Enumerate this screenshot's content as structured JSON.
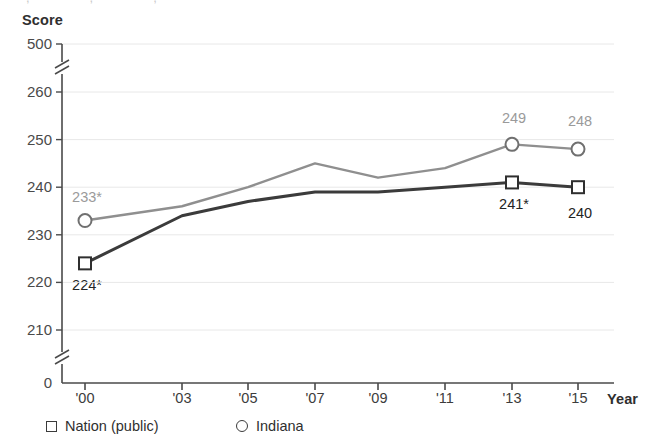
{
  "chart_data": {
    "type": "line",
    "title": "",
    "xlabel": "Year",
    "ylabel": "Score",
    "x": [
      "'00",
      "'03",
      "'05",
      "'07",
      "'09",
      "'11",
      "'13",
      "'15"
    ],
    "x_values": [
      2000,
      2003,
      2005,
      2007,
      2009,
      2011,
      2013,
      2015
    ],
    "ylim": [
      0,
      500
    ],
    "y_ticks": [
      "0",
      "210",
      "220",
      "230",
      "240",
      "250",
      "260",
      "500"
    ],
    "y_tick_values": [
      0,
      210,
      220,
      230,
      240,
      250,
      260,
      500
    ],
    "axis_breaks": [
      "between 0 and 210",
      "between 260 and 500"
    ],
    "grid": true,
    "legend_position": "bottom",
    "series": [
      {
        "name": "Nation (public)",
        "marker": "square",
        "color": "#3b3b3b",
        "values": [
          224,
          234,
          237,
          239,
          239,
          240,
          241,
          240
        ],
        "point_labels": [
          "224*",
          "",
          "",
          "",
          "",
          "",
          "241*",
          "240"
        ],
        "labeled_points": [
          {
            "x": "'00",
            "value": 224,
            "label": "224*"
          },
          {
            "x": "'13",
            "value": 241,
            "label": "241*"
          },
          {
            "x": "'15",
            "value": 240,
            "label": "240"
          }
        ]
      },
      {
        "name": "Indiana",
        "marker": "circle",
        "color": "#8f8f8f",
        "values": [
          233,
          236,
          240,
          245,
          242,
          244,
          249,
          248
        ],
        "point_labels": [
          "233*",
          "",
          "",
          "",
          "",
          "",
          "249",
          "248"
        ],
        "labeled_points": [
          {
            "x": "'00",
            "value": 233,
            "label": "233*"
          },
          {
            "x": "'13",
            "value": 249,
            "label": "249"
          },
          {
            "x": "'15",
            "value": 248,
            "label": "248"
          }
        ]
      }
    ]
  },
  "axes": {
    "y_title": "Score",
    "x_title": "Year"
  },
  "legend": {
    "items": [
      {
        "label": "Nation (public)",
        "marker": "square"
      },
      {
        "label": "Indiana",
        "marker": "circle"
      }
    ]
  },
  "colors": {
    "nation_line": "#3b3b3b",
    "indiana_line": "#8f8f8f",
    "axis": "#4a4a4a",
    "grid": "#e8e8e8",
    "label_nation": "#242424",
    "label_indiana": "#9a9a9a"
  }
}
